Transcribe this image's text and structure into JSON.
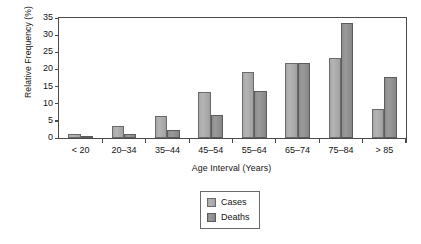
{
  "chart_data": {
    "type": "bar",
    "title": "",
    "xlabel": "Age Interval (Years)",
    "ylabel": "Relative Frequency (%)",
    "categories": [
      "< 20",
      "20–34",
      "35–44",
      "45–54",
      "55–64",
      "65–74",
      "75–84",
      "> 85"
    ],
    "series": [
      {
        "name": "Cases",
        "color": "#b0b0b0",
        "values": [
          1.3,
          3.5,
          6.5,
          13.4,
          19.2,
          22.0,
          23.3,
          8.5
        ]
      },
      {
        "name": "Deaths",
        "color": "#8e8e8e",
        "values": [
          0.2,
          1.3,
          2.4,
          6.7,
          13.7,
          22.0,
          33.6,
          17.9
        ]
      }
    ],
    "ylim": [
      0,
      35
    ],
    "yticks": [
      0,
      5,
      10,
      15,
      20,
      25,
      30,
      35
    ],
    "ytick_labels": [
      "0",
      "5",
      "10",
      "15",
      "20",
      "25",
      "30",
      "35"
    ],
    "grid": false,
    "legend_position": "bottom-center",
    "axis_color": "#4a4a4a",
    "background": "#ffffff"
  },
  "legend": {
    "items": [
      {
        "label": "Cases"
      },
      {
        "label": "Deaths"
      }
    ]
  }
}
